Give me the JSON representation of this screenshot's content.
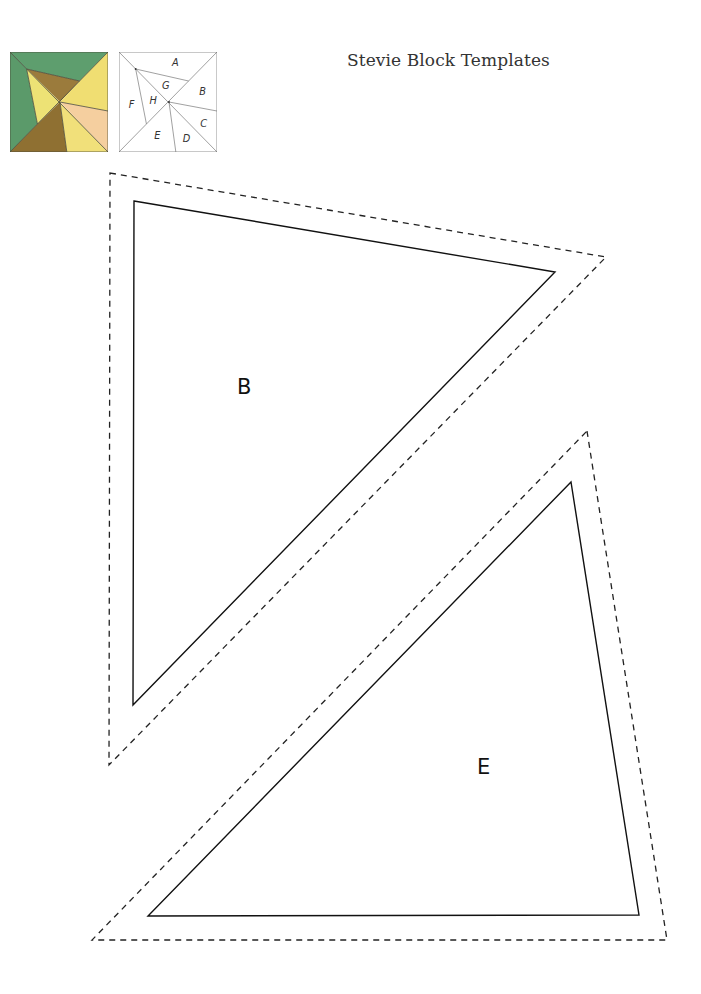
{
  "header": {
    "title": "Stevie Block Templates"
  },
  "block_preview": {
    "colors": {
      "green": "#5e9e6e",
      "yellow": "#f0de72",
      "brown": "#9b7b3c",
      "dark_brown": "#8a6b2e",
      "peach": "#f5cf9f",
      "line": "#4a4a3a"
    }
  },
  "block_diagram": {
    "labels": {
      "A": "A",
      "B": "B",
      "C": "C",
      "D": "D",
      "E": "E",
      "F": "F",
      "G": "G",
      "H": "H"
    }
  },
  "templates": [
    {
      "label": "B",
      "cut_line": "dashed",
      "sew_line": "solid"
    },
    {
      "label": "E",
      "cut_line": "dashed",
      "sew_line": "solid"
    }
  ]
}
